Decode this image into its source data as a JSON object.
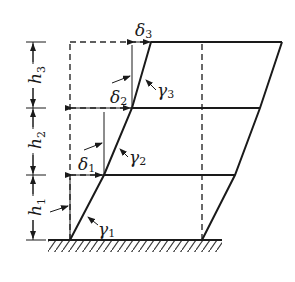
{
  "diagram": {
    "type": "shear-building-drift",
    "colors": {
      "line": "#1a1a1a",
      "dashed": "#2a2a2a",
      "background": "#ffffff"
    },
    "storeys": [
      {
        "height_label": "h",
        "height_sub": "1",
        "drift_label": "δ",
        "drift_sub": "1",
        "angle_label": "γ",
        "angle_sub": "1"
      },
      {
        "height_label": "h",
        "height_sub": "2",
        "drift_label": "δ",
        "drift_sub": "2",
        "angle_label": "γ",
        "angle_sub": "2"
      },
      {
        "height_label": "h",
        "height_sub": "3",
        "drift_label": "δ",
        "drift_sub": "3",
        "angle_label": "γ",
        "angle_sub": "3"
      }
    ]
  }
}
